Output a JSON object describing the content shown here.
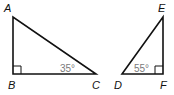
{
  "figure": {
    "triangles": [
      {
        "name": "ABC",
        "vertices": [
          {
            "label": "A",
            "x": 13,
            "y": 17,
            "lx": 4,
            "ly": 12
          },
          {
            "label": "B",
            "x": 13,
            "y": 74,
            "lx": 8,
            "ly": 89
          },
          {
            "label": "C",
            "x": 96,
            "y": 74,
            "lx": 92,
            "ly": 89
          }
        ],
        "right_angle_at": "B",
        "angle_label": {
          "text": "35°",
          "at": "C",
          "x": 60,
          "y": 73
        }
      },
      {
        "name": "DEF",
        "vertices": [
          {
            "label": "D",
            "x": 122,
            "y": 74,
            "lx": 114,
            "ly": 89
          },
          {
            "label": "E",
            "x": 163,
            "y": 17,
            "lx": 158,
            "ly": 12
          },
          {
            "label": "F",
            "x": 163,
            "y": 74,
            "lx": 160,
            "ly": 89
          }
        ],
        "right_angle_at": "F",
        "angle_label": {
          "text": "55°",
          "at": "D",
          "x": 134,
          "y": 73
        }
      }
    ],
    "colors": {
      "line": "#111111",
      "angle_text": "#7a7a7a"
    }
  }
}
